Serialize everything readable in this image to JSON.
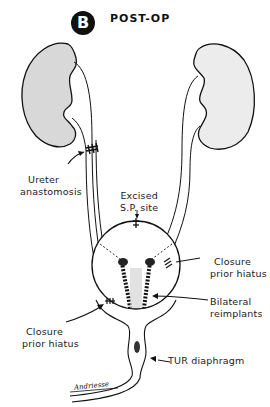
{
  "figure": {
    "panel_letter": "B",
    "title": "POST-OP",
    "signature": "Andriesse"
  },
  "labels": {
    "ureter_anastomosis": [
      "Ureter",
      "anastomosis"
    ],
    "excised_sp_site": [
      "Excised",
      "S.P. site"
    ],
    "closure_prior_hiatus_right": [
      "Closure",
      "prior hiatus"
    ],
    "bilateral_reimplants": [
      "Bilateral",
      "reimplants"
    ],
    "closure_prior_hiatus_left": [
      "Closure",
      "prior hiatus"
    ],
    "tur_diaphragm": "TUR diaphragm"
  },
  "colors": {
    "line": "#111111",
    "kidney_left_fill": "#d8d8d8",
    "kidney_right_fill": "#ececec",
    "background": "#ffffff"
  }
}
